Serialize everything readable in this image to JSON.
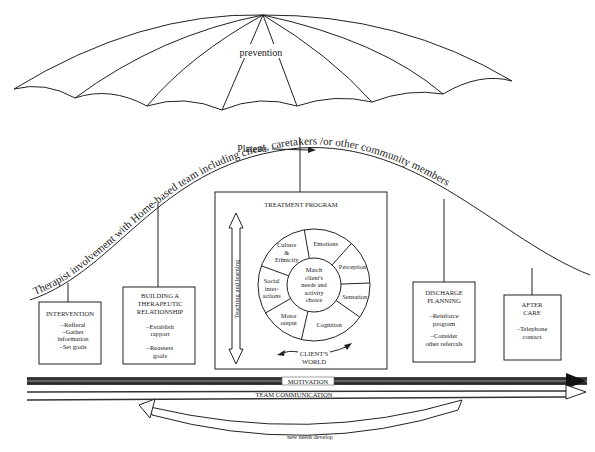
{
  "umbrella": {
    "label": "prevention"
  },
  "curve": {
    "label": "Therapist involvement with Home-based team including client, caretakers /or other community members",
    "plateau_label": "Plateau"
  },
  "stages": [
    {
      "title_lines": [
        "INTERVENTION"
      ],
      "items": [
        "–Refferal",
        "–Gather",
        "information",
        "–Set goals"
      ]
    },
    {
      "title_lines": [
        "BUILDING A",
        "THERAPEUTIC",
        "RELATIONSHIP"
      ],
      "items": [
        "–Establish",
        "rapport",
        "–Reassess",
        "goals"
      ]
    },
    {
      "title_lines": [
        "DISCHARGE",
        "PLANNING"
      ],
      "items": [
        "–Reinforce",
        "program",
        "–Consider",
        "other referrals"
      ]
    },
    {
      "title_lines": [
        "AFTER",
        "CARE"
      ],
      "items": [
        "–Telephone",
        "contact"
      ]
    }
  ],
  "treatment_program": {
    "title": "TREATMENT PROGRAM",
    "side_arrow_label": "Teaching and learning",
    "center_lines": [
      "Match",
      "client's",
      "needs and",
      "activity",
      "choice"
    ],
    "segments": [
      {
        "lines": [
          "Emotions"
        ]
      },
      {
        "lines": [
          "Perception"
        ]
      },
      {
        "lines": [
          "Sensation"
        ]
      },
      {
        "lines": [
          "Cognition"
        ]
      },
      {
        "lines": [
          "Motor",
          "output"
        ]
      },
      {
        "lines": [
          "Social",
          "inter-",
          "actions"
        ]
      },
      {
        "lines": [
          "Culture",
          "&",
          "Ethnicity"
        ]
      }
    ],
    "world_label_lines": [
      "CLIENT'S",
      "WORLD"
    ]
  },
  "bars": {
    "motivation": "MOTIVATION",
    "team_communication": "TEAM COMMUNICATION"
  },
  "loop_arrow": {
    "label": "new needs develop"
  }
}
